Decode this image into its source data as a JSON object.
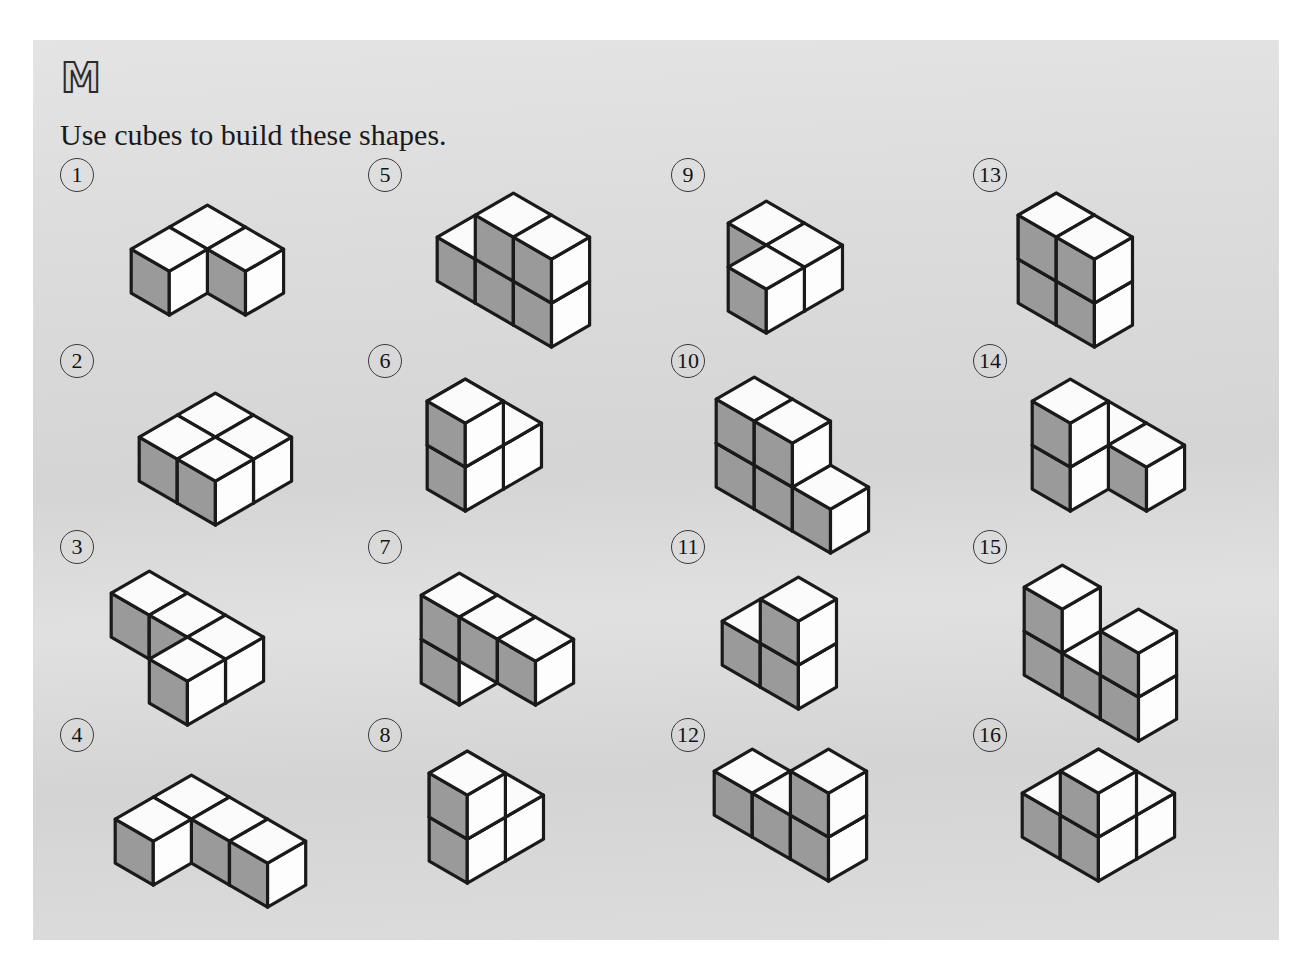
{
  "page": {
    "logo": "M",
    "instruction": "Use cubes to build these shapes.",
    "background_color": "#d8d8d8",
    "page_border_color": "#ffffff"
  },
  "cube_style": {
    "top_face_color": "#fbfbfb",
    "left_face_color": "#9a9a9a",
    "right_face_color": "#fdfdfd",
    "outline_color": "#1a1a1a",
    "outline_width": 3.2,
    "cube_size": 44
  },
  "grid": {
    "columns": 4,
    "rows": 4,
    "column_x": [
      27,
      335,
      638,
      940
    ],
    "row_y": [
      0,
      186,
      372,
      560
    ]
  },
  "problems": [
    {
      "number": "1",
      "column": 0,
      "row": 0,
      "cube_count": 3,
      "shape_offset": [
        68,
        26
      ],
      "voxels": [
        [
          0,
          0,
          0
        ],
        [
          1,
          0,
          0
        ],
        [
          0,
          1,
          0
        ]
      ]
    },
    {
      "number": "2",
      "column": 0,
      "row": 1,
      "cube_count": 4,
      "shape_offset": [
        76,
        28
      ],
      "voxels": [
        [
          0,
          0,
          0
        ],
        [
          1,
          0,
          0
        ],
        [
          0,
          1,
          0
        ],
        [
          1,
          1,
          0
        ]
      ]
    },
    {
      "number": "3",
      "column": 0,
      "row": 2,
      "cube_count": 4,
      "shape_offset": [
        48,
        20
      ],
      "voxels": [
        [
          0,
          0,
          0
        ],
        [
          1,
          0,
          0
        ],
        [
          2,
          0,
          0
        ],
        [
          2,
          1,
          0
        ]
      ]
    },
    {
      "number": "4",
      "column": 0,
      "row": 3,
      "cube_count": 4,
      "shape_offset": [
        52,
        36
      ],
      "voxels": [
        [
          0,
          0,
          0
        ],
        [
          1,
          0,
          0
        ],
        [
          2,
          0,
          0
        ],
        [
          0,
          1,
          0
        ]
      ]
    },
    {
      "number": "5",
      "column": 1,
      "row": 0,
      "cube_count": 5,
      "shape_offset": [
        66,
        14
      ],
      "voxels": [
        [
          0,
          0,
          0
        ],
        [
          1,
          0,
          0
        ],
        [
          2,
          0,
          0
        ],
        [
          1,
          0,
          1
        ],
        [
          2,
          0,
          1
        ]
      ]
    },
    {
      "number": "6",
      "column": 1,
      "row": 1,
      "cube_count": 4,
      "shape_offset": [
        56,
        14
      ],
      "voxels": [
        [
          0,
          0,
          0
        ],
        [
          1,
          0,
          0
        ],
        [
          1,
          1,
          0
        ],
        [
          1,
          1,
          1
        ]
      ]
    },
    {
      "number": "7",
      "column": 1,
      "row": 2,
      "cube_count": 4,
      "shape_offset": [
        50,
        22
      ],
      "voxels": [
        [
          0,
          0,
          0
        ],
        [
          0,
          0,
          1
        ],
        [
          1,
          0,
          1
        ],
        [
          2,
          0,
          1
        ]
      ]
    },
    {
      "number": "8",
      "column": 1,
      "row": 3,
      "cube_count": 4,
      "shape_offset": [
        58,
        12
      ],
      "voxels": [
        [
          0,
          0,
          0
        ],
        [
          1,
          0,
          0
        ],
        [
          1,
          1,
          0
        ],
        [
          1,
          1,
          1
        ]
      ]
    },
    {
      "number": "9",
      "column": 2,
      "row": 0,
      "cube_count": 3,
      "shape_offset": [
        54,
        22
      ],
      "voxels": [
        [
          0,
          0,
          0
        ],
        [
          1,
          1,
          0
        ],
        [
          1,
          0,
          0
        ]
      ]
    },
    {
      "number": "10",
      "column": 2,
      "row": 1,
      "cube_count": 5,
      "shape_offset": [
        42,
        12
      ],
      "voxels": [
        [
          0,
          0,
          0
        ],
        [
          1,
          0,
          0
        ],
        [
          2,
          0,
          0
        ],
        [
          0,
          0,
          1
        ],
        [
          1,
          0,
          1
        ]
      ]
    },
    {
      "number": "11",
      "column": 2,
      "row": 2,
      "cube_count": 3,
      "shape_offset": [
        48,
        26
      ],
      "voxels": [
        [
          0,
          0,
          0
        ],
        [
          1,
          0,
          0
        ],
        [
          1,
          0,
          1
        ]
      ]
    },
    {
      "number": "12",
      "column": 2,
      "row": 3,
      "cube_count": 4,
      "shape_offset": [
        40,
        10
      ],
      "voxels": [
        [
          0,
          0,
          0
        ],
        [
          1,
          0,
          0
        ],
        [
          2,
          0,
          0
        ],
        [
          2,
          0,
          1
        ]
      ]
    },
    {
      "number": "13",
      "column": 3,
      "row": 0,
      "cube_count": 5,
      "shape_offset": [
        42,
        14
      ],
      "voxels": [
        [
          0,
          0,
          0
        ],
        [
          1,
          1,
          0
        ],
        [
          2,
          1,
          0
        ],
        [
          1,
          1,
          1
        ],
        [
          2,
          1,
          1
        ]
      ]
    },
    {
      "number": "14",
      "column": 3,
      "row": 1,
      "cube_count": 4,
      "shape_offset": [
        56,
        14
      ],
      "voxels": [
        [
          0,
          0,
          0
        ],
        [
          1,
          0,
          0
        ],
        [
          0,
          1,
          0
        ],
        [
          0,
          1,
          1
        ]
      ]
    },
    {
      "number": "15",
      "column": 3,
      "row": 2,
      "cube_count": 5,
      "shape_offset": [
        48,
        14
      ],
      "voxels": [
        [
          0,
          0,
          0
        ],
        [
          1,
          0,
          0
        ],
        [
          2,
          0,
          0
        ],
        [
          0,
          0,
          1
        ],
        [
          2,
          0,
          1
        ]
      ]
    },
    {
      "number": "16",
      "column": 3,
      "row": 3,
      "cube_count": 5,
      "shape_offset": [
        46,
        10
      ],
      "voxels": [
        [
          0,
          0,
          0
        ],
        [
          1,
          0,
          0
        ],
        [
          0,
          1,
          0
        ],
        [
          1,
          1,
          0
        ],
        [
          1,
          1,
          1
        ]
      ]
    }
  ]
}
